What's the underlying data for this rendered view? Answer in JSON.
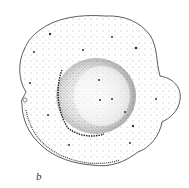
{
  "figure": {
    "panel_label": "b",
    "ink_color": "#2a2a2a",
    "background": "#ffffff"
  }
}
